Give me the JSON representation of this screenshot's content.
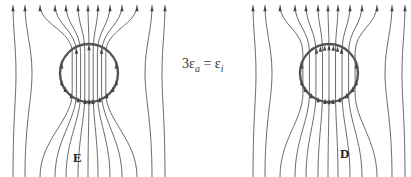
{
  "equation": {
    "coef": "3",
    "lhs_symbol": "ε",
    "lhs_sub": "a",
    "equals": "=",
    "rhs_symbol": "ε",
    "rhs_sub": "i"
  },
  "panels": [
    {
      "label": "E",
      "cx": 89,
      "cy": 73,
      "r": 29,
      "interior_lines": [
        76,
        88,
        100
      ],
      "lines_x": [
        13,
        25,
        40,
        55,
        66,
        78,
        88,
        98,
        110,
        122,
        137,
        152,
        165
      ]
    },
    {
      "label": "D",
      "cx": 329,
      "cy": 73,
      "r": 29,
      "interior_lines": [
        305,
        311,
        317,
        323,
        329,
        335,
        341,
        347,
        353
      ],
      "lines_x": [
        253,
        265,
        280,
        295,
        306,
        318,
        328,
        338,
        350,
        362,
        377,
        392,
        405
      ]
    }
  ],
  "colors": {
    "field_line": "#6b6b6b",
    "circle": "#555555",
    "arrow": "#444444",
    "text": "#222222"
  }
}
